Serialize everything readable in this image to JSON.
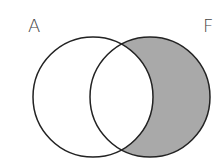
{
  "diagram": {
    "type": "venn",
    "sets": [
      {
        "label": "A",
        "cx": 93,
        "cy": 97,
        "r": 60
      },
      {
        "label": "F",
        "cx": 150,
        "cy": 97,
        "r": 60
      }
    ],
    "shaded_region": "F minus A",
    "colors": {
      "stroke": "#222222",
      "shade": "#a9a9a9",
      "background": "#ffffff"
    }
  }
}
